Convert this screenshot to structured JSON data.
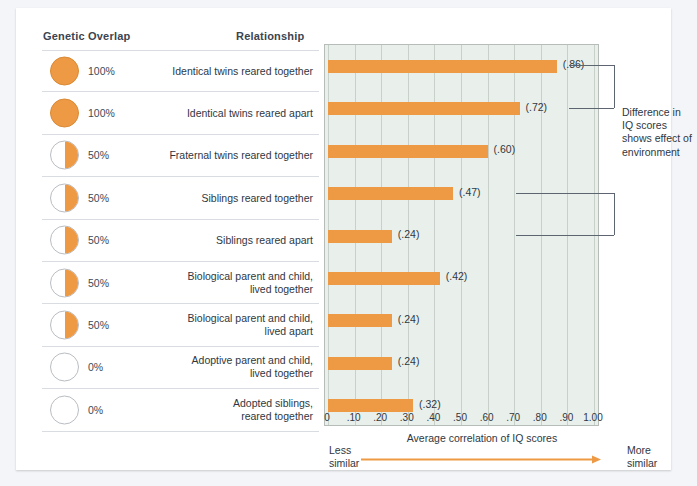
{
  "headers": {
    "genetic_overlap": "Genetic Overlap",
    "relationship": "Relationship"
  },
  "annotation": {
    "text": "Difference in IQ scores shows effect of environment"
  },
  "axis": {
    "caption": "Average correlation of IQ scores",
    "less_similar": "Less similar",
    "more_similar": "More similar",
    "arrow_icon": "right-arrow-icon"
  },
  "colors": {
    "bar": "#ee9a45",
    "plot_background": "#e9efea",
    "gridline": "#c7d0c9",
    "text": "#2f3742",
    "row_rule": "#d9dde2",
    "bracket": "#5d6670"
  },
  "rows": [
    {
      "overlap": "100%",
      "overlap_value": 100,
      "relationship": "Identical twins reared together",
      "value": 0.86,
      "label": "(.86)"
    },
    {
      "overlap": "100%",
      "overlap_value": 100,
      "relationship": "Identical twins reared apart",
      "value": 0.72,
      "label": "(.72)"
    },
    {
      "overlap": "50%",
      "overlap_value": 50,
      "relationship": "Fraternal twins reared together",
      "value": 0.6,
      "label": "(.60)"
    },
    {
      "overlap": "50%",
      "overlap_value": 50,
      "relationship": "Siblings reared together",
      "value": 0.47,
      "label": "(.47)"
    },
    {
      "overlap": "50%",
      "overlap_value": 50,
      "relationship": "Siblings reared apart",
      "value": 0.24,
      "label": "(.24)"
    },
    {
      "overlap": "50%",
      "overlap_value": 50,
      "relationship": "Biological parent and child, lived together",
      "value": 0.42,
      "label": "(.42)"
    },
    {
      "overlap": "50%",
      "overlap_value": 50,
      "relationship": "Biological parent and child, lived apart",
      "value": 0.24,
      "label": "(.24)"
    },
    {
      "overlap": "0%",
      "overlap_value": 0,
      "relationship": "Adoptive parent and child, lived together",
      "value": 0.24,
      "label": "(.24)"
    },
    {
      "overlap": "0%",
      "overlap_value": 0,
      "relationship": "Adopted siblings, reared together",
      "value": 0.32,
      "label": "(.32)"
    }
  ],
  "chart_data": {
    "type": "bar",
    "title": "",
    "orientation": "horizontal",
    "xlabel": "Average correlation of IQ scores",
    "ylabel": "",
    "xlim": [
      0,
      1.0
    ],
    "grid": true,
    "legend": "none",
    "xticks": [
      0,
      0.1,
      0.2,
      0.3,
      0.4,
      0.5,
      0.6,
      0.7,
      0.8,
      0.9,
      1.0
    ],
    "xticklabels": [
      "0",
      ".10",
      ".20",
      ".30",
      ".40",
      ".50",
      ".60",
      ".70",
      ".80",
      ".90",
      "1.00"
    ],
    "categories": [
      "Identical twins reared together",
      "Identical twins reared apart",
      "Fraternal twins reared together",
      "Siblings reared together",
      "Siblings reared apart",
      "Biological parent and child, lived together",
      "Biological parent and child, lived apart",
      "Adoptive parent and child, lived together",
      "Adopted siblings, reared together"
    ],
    "values": [
      0.86,
      0.72,
      0.6,
      0.47,
      0.24,
      0.42,
      0.24,
      0.24,
      0.32
    ],
    "data_labels": [
      "(.86)",
      "(.72)",
      "(.60)",
      "(.47)",
      "(.24)",
      "(.42)",
      "(.24)",
      "(.24)",
      "(.32)"
    ],
    "genetic_overlap_percent": [
      100,
      100,
      50,
      50,
      50,
      50,
      50,
      0,
      0
    ],
    "annotations": [
      {
        "text": "Difference in IQ scores shows effect of environment",
        "connects": [
          "Identical twins reared together",
          "Identical twins reared apart"
        ]
      },
      {
        "text": "Difference in IQ scores shows effect of environment",
        "connects": [
          "Siblings reared together",
          "Siblings reared apart"
        ]
      }
    ],
    "axis_direction_labels": {
      "left": "Less similar",
      "right": "More similar"
    }
  }
}
